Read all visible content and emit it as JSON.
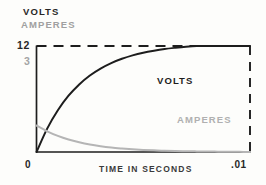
{
  "legend": {
    "position": "top-left",
    "entries": [
      {
        "label": "VOLTS",
        "color": "#272727"
      },
      {
        "label": "AMPERES",
        "color": "#a0a0a0"
      }
    ]
  },
  "axes": {
    "y_ticks": [
      {
        "label": "12",
        "value": 12,
        "color": "#272727"
      },
      {
        "label": "3",
        "value": 3,
        "color": "#a4a4a4"
      },
      {
        "label": "0",
        "value": 0,
        "color": "#272727"
      }
    ],
    "x_ticks": [
      {
        "label": "0",
        "value": 0
      },
      {
        "label": ".01",
        "value": 0.01
      }
    ],
    "x_title": "TIME IN SECONDS",
    "y_title": ""
  },
  "annotations": [
    {
      "name": "volts-curve-label",
      "text": "VOLTS",
      "color": "#1d1d1d"
    },
    {
      "name": "amperes-curve-label",
      "text": "AMPERES",
      "color": "#b0b0b0"
    }
  ],
  "chart_data": {
    "type": "line",
    "title": "",
    "subtitle": "",
    "xlabel": "TIME IN SECONDS",
    "ylabel": "",
    "xlim": [
      0,
      0.01
    ],
    "ylim": [
      0,
      12
    ],
    "grid": false,
    "legend_position": "top-left",
    "x_tick_labels": [
      "0",
      ".01"
    ],
    "y_tick_labels": [
      "12",
      "3",
      "0"
    ],
    "reference_lines": [
      {
        "name": "asymptote-12-volts",
        "orientation": "horizontal",
        "value": 12,
        "style": "dashed",
        "color": "#1d1d1d"
      },
      {
        "name": "end-of-interval",
        "orientation": "vertical",
        "value": 0.01,
        "style": "dashed",
        "color": "#1d1d1d"
      }
    ],
    "x": [
      0,
      0.0005,
      0.001,
      0.0015,
      0.002,
      0.0025,
      0.003,
      0.0035,
      0.004,
      0.0045,
      0.005,
      0.0055,
      0.006,
      0.0065,
      0.007,
      0.0075,
      0.008,
      0.0085,
      0.009,
      0.0095,
      0.01
    ],
    "series": [
      {
        "name": "VOLTS",
        "color": "#1d1d1d",
        "axis": "left",
        "unit": "volts",
        "style": "solid",
        "values": [
          0.0,
          2.65,
          4.73,
          6.37,
          7.65,
          8.66,
          9.45,
          10.07,
          10.55,
          10.94,
          11.24,
          11.47,
          11.66,
          11.8,
          11.92,
          12.0,
          12.0,
          12.0,
          12.0,
          12.0,
          12.0
        ]
      },
      {
        "name": "AMPERES",
        "color": "#b5b5b5",
        "axis": "left",
        "unit": "amperes",
        "style": "solid",
        "values": [
          3.0,
          2.34,
          1.82,
          1.41,
          1.1,
          0.85,
          0.66,
          0.51,
          0.4,
          0.31,
          0.24,
          0.19,
          0.14,
          0.11,
          0.09,
          0.07,
          0.05,
          0.04,
          0.03,
          0.02,
          0.0
        ]
      }
    ]
  }
}
